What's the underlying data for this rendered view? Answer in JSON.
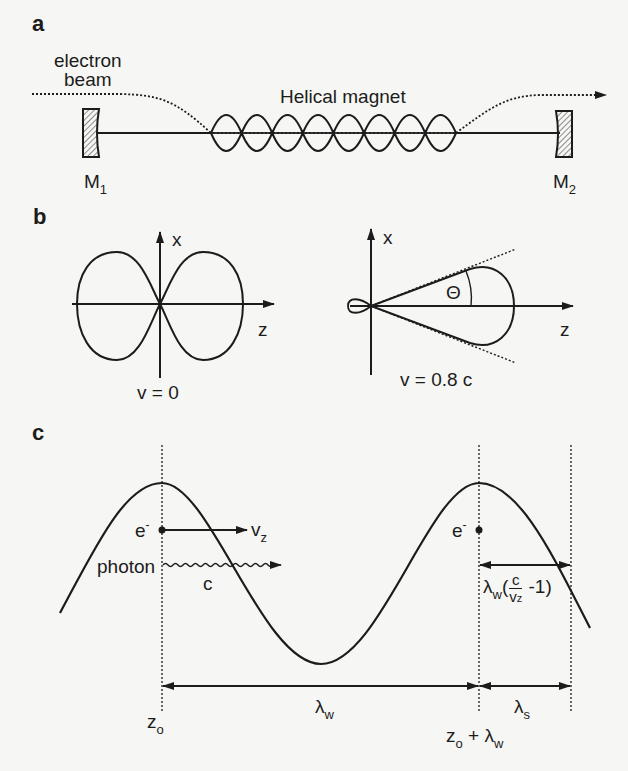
{
  "panel_a": {
    "letter": "a",
    "electron_beam_label_line1": "electron",
    "electron_beam_label_line2": "beam",
    "magnet_label": "Helical magnet",
    "mirror1": {
      "name": "M",
      "sub": "1"
    },
    "mirror2": {
      "name": "M",
      "sub": "2"
    },
    "helix_lobes": 8
  },
  "panel_b": {
    "letter": "b",
    "left_plot": {
      "x_axis": "x",
      "z_axis": "z",
      "caption": "v = 0"
    },
    "right_plot": {
      "x_axis": "x",
      "z_axis": "z",
      "angle_label": "Θ",
      "caption": "v = 0.8 c"
    }
  },
  "panel_c": {
    "letter": "c",
    "electron_left": {
      "symbol": "e",
      "sup": "-"
    },
    "electron_right": {
      "symbol": "e",
      "sup": "-"
    },
    "velocity_label": {
      "main": "v",
      "sub": "z"
    },
    "photon_label": "photon",
    "photon_speed_label": "c",
    "slip_label": {
      "lambda": "λ",
      "lambda_sub": "w",
      "open": "(",
      "num": "c",
      "den_main": "v",
      "den_sub": "z",
      "tail": " -1)"
    },
    "wiggler_period": {
      "main": "λ",
      "sub": "w"
    },
    "emitted_wavelength": {
      "main": "λ",
      "sub": "s"
    },
    "z0": {
      "main": "z",
      "sub": "o"
    },
    "z0_plus": {
      "main": "z",
      "sub": "o",
      "plus": " + ",
      "lambda": "λ",
      "lambda_sub": "w"
    }
  },
  "colors": {
    "ink": "#1c1c1c",
    "paper": "#f6f6f4",
    "hatch": "#555555"
  }
}
